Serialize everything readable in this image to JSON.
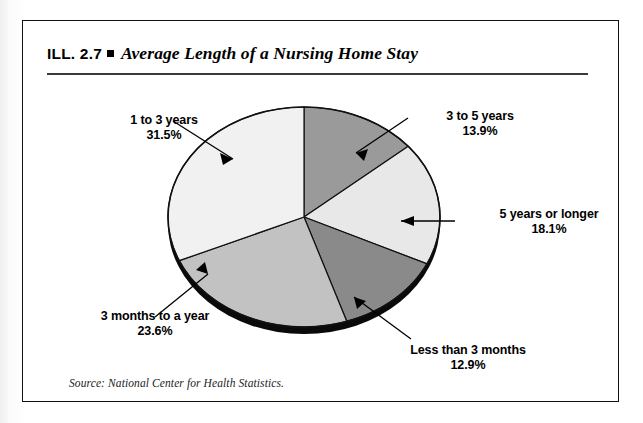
{
  "figure": {
    "ill_label": "ILL. 2.7",
    "bullet": "square-bullet",
    "title": "Average Length of a Nursing Home Stay",
    "source": "Source: National Center for Health Statistics."
  },
  "chart_data": {
    "type": "pie",
    "title": "Average Length of a Nursing Home Stay",
    "xlabel": "",
    "ylabel": "",
    "legend_position": "callout-labels",
    "grid": false,
    "units": "percent",
    "total": 100.0,
    "categories": [
      "3 to 5 years",
      "5 years or longer",
      "Less than 3 months",
      "3 months to a year",
      "1 to 3 years"
    ],
    "values": [
      13.9,
      18.1,
      12.9,
      23.6,
      31.5
    ],
    "slices": [
      {
        "label": "3 to 5 years",
        "value": 13.9,
        "value_text": "13.9%",
        "color": "#9a9a9a",
        "start_angle_deg": 0.0,
        "end_angle_deg": 50.04
      },
      {
        "label": "5 years or longer",
        "value": 18.1,
        "value_text": "18.1%",
        "color": "#e8e8e8",
        "start_angle_deg": 50.04,
        "end_angle_deg": 115.2
      },
      {
        "label": "Less than 3 months",
        "value": 12.9,
        "value_text": "12.9%",
        "color": "#8a8a8a",
        "start_angle_deg": 115.2,
        "end_angle_deg": 161.64
      },
      {
        "label": "3 months to a year",
        "value": 23.6,
        "value_text": "23.6%",
        "color": "#c2c2c2",
        "start_angle_deg": 161.64,
        "end_angle_deg": 246.6
      },
      {
        "label": "1 to 3 years",
        "value": 31.5,
        "value_text": "31.5%",
        "color": "#f1f1f1",
        "start_angle_deg": 246.6,
        "end_angle_deg": 360.0
      }
    ]
  },
  "callouts": {
    "one_to_three": {
      "label": "1 to 3 years",
      "value_text": "31.5%"
    },
    "three_to_five": {
      "label": "3 to 5 years",
      "value_text": "13.9%"
    },
    "five_plus": {
      "label": "5 years or longer",
      "value_text": "18.1%"
    },
    "less_than_three_months": {
      "label": "Less than 3 months",
      "value_text": "12.9%"
    },
    "three_months_to_year": {
      "label": "3 months to a year",
      "value_text": "23.6%"
    }
  },
  "colors": {
    "frame": "#111111",
    "rule": "#3a3a3a",
    "text": "#000000",
    "pie_outline": "#111111",
    "pie_shadow": "#0a0a0a",
    "background": "#ffffff"
  }
}
